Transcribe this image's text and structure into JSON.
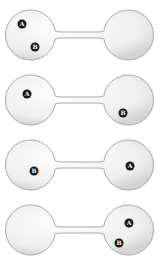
{
  "diagram": {
    "colors": {
      "bulb_fill": "#eeeeee",
      "bulb_highlight": "#ffffff",
      "bulb_stroke": "#a9a9a9",
      "particle_fill": "#1a1a1a",
      "particle_label": "#ffffff"
    },
    "panels": [
      {
        "top": 0,
        "particles": [
          {
            "label": "A",
            "bulb": "left",
            "cx": 22,
            "cy": 24
          },
          {
            "label": "B",
            "bulb": "left",
            "cx": 35,
            "cy": 47
          }
        ]
      },
      {
        "top": 65,
        "particles": [
          {
            "label": "A",
            "bulb": "left",
            "cx": 27,
            "cy": 29
          },
          {
            "label": "B",
            "bulb": "right",
            "cx": 123,
            "cy": 48
          }
        ]
      },
      {
        "top": 130,
        "particles": [
          {
            "label": "B",
            "bulb": "left",
            "cx": 34,
            "cy": 41
          },
          {
            "label": "A",
            "bulb": "right",
            "cx": 130,
            "cy": 36
          }
        ]
      },
      {
        "top": 195,
        "particles": [
          {
            "label": "A",
            "bulb": "right",
            "cx": 129,
            "cy": 28
          },
          {
            "label": "B",
            "bulb": "right",
            "cx": 119,
            "cy": 48
          }
        ]
      }
    ]
  }
}
